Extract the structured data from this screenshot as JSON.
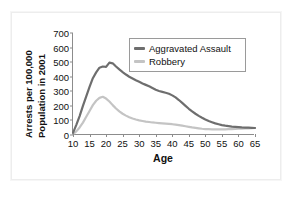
{
  "chart_data": {
    "type": "line",
    "title": "",
    "xlabel": "Age",
    "ylabel_line1": "Arrests per 100,000",
    "ylabel_line2": "Population in 2001",
    "xlim": [
      10,
      65
    ],
    "ylim": [
      0,
      700
    ],
    "xticks": [
      10,
      15,
      20,
      25,
      30,
      35,
      40,
      45,
      50,
      55,
      60,
      65
    ],
    "yticks": [
      0,
      100,
      200,
      300,
      400,
      500,
      600,
      700
    ],
    "grid": false,
    "legend_position": "top-right-inside",
    "series": [
      {
        "name": "Aggravated Assault",
        "color": "#6e6e6e",
        "x": [
          10,
          11,
          12,
          13,
          14,
          15,
          16,
          17,
          18,
          19,
          20,
          21,
          22,
          23,
          24,
          25,
          26,
          27,
          28,
          29,
          30,
          31,
          32,
          33,
          34,
          35,
          36,
          37,
          38,
          39,
          40,
          41,
          42,
          43,
          44,
          45,
          46,
          47,
          48,
          49,
          50,
          51,
          52,
          53,
          54,
          55,
          56,
          57,
          58,
          59,
          60,
          61,
          62,
          63,
          64,
          65
        ],
        "values": [
          15,
          70,
          130,
          200,
          265,
          330,
          390,
          430,
          462,
          470,
          468,
          497,
          492,
          470,
          450,
          432,
          415,
          400,
          388,
          376,
          365,
          354,
          344,
          334,
          322,
          310,
          302,
          296,
          290,
          283,
          272,
          258,
          240,
          220,
          200,
          180,
          162,
          146,
          131,
          118,
          106,
          96,
          88,
          80,
          74,
          68,
          64,
          61,
          58,
          56,
          54,
          52,
          51,
          50,
          49,
          48
        ]
      },
      {
        "name": "Robbery",
        "color": "#c4c4c4",
        "x": [
          10,
          11,
          12,
          13,
          14,
          15,
          16,
          17,
          18,
          19,
          20,
          21,
          22,
          23,
          24,
          25,
          26,
          27,
          28,
          29,
          30,
          31,
          32,
          33,
          34,
          35,
          36,
          37,
          38,
          39,
          40,
          41,
          42,
          43,
          44,
          45,
          46,
          47,
          48,
          49,
          50,
          51,
          52,
          53,
          54,
          55,
          56,
          57,
          58,
          59,
          60,
          61,
          62,
          63,
          64,
          65
        ],
        "values": [
          6,
          25,
          52,
          85,
          125,
          165,
          205,
          235,
          255,
          262,
          250,
          230,
          205,
          182,
          162,
          146,
          133,
          122,
          113,
          106,
          100,
          96,
          92,
          89,
          86,
          84,
          82,
          80,
          78,
          76,
          74,
          71,
          68,
          64,
          60,
          56,
          52,
          49,
          46,
          43,
          41,
          40,
          39,
          38,
          38,
          38,
          39,
          40,
          41,
          42,
          43,
          44,
          45,
          46,
          47,
          48
        ]
      }
    ],
    "legend": [
      {
        "label": "Aggravated Assault",
        "color": "#6e6e6e"
      },
      {
        "label": "Robbery",
        "color": "#c4c4c4"
      }
    ]
  },
  "colors": {
    "assault": "#6e6e6e",
    "robbery": "#c4c4c4",
    "axis": "#8c8c8c",
    "text": "#111111",
    "frame": "#ededed",
    "background": "#ffffff"
  }
}
